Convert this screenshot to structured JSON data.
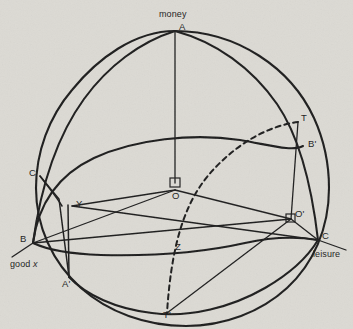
{
  "figure": {
    "background_color": "#dcdad4",
    "ink_color": "#1d1d1d"
  },
  "axis_labels": {
    "money": "money",
    "good_x_prefix": "good ",
    "good_x_italic": "x",
    "leisure": "leisure"
  },
  "points": [
    {
      "id": "A",
      "label": "A",
      "x": 175,
      "y": 31,
      "label_x": 179,
      "label_y": 22
    },
    {
      "id": "B",
      "label": "B",
      "x": 33,
      "y": 243,
      "label_x": 20,
      "label_y": 234
    },
    {
      "id": "C",
      "label": "C",
      "x": 318,
      "y": 240,
      "label_x": 322,
      "label_y": 231
    },
    {
      "id": "O",
      "label": "O",
      "x": 175,
      "y": 190,
      "label_x": 172,
      "label_y": 192
    },
    {
      "id": "O'",
      "label": "O'",
      "x": 291,
      "y": 219,
      "label_x": 295,
      "label_y": 210
    },
    {
      "id": "A'",
      "label": "A'",
      "x": 69,
      "y": 277,
      "label_x": 62,
      "label_y": 279
    },
    {
      "id": "B'",
      "label": "B'",
      "x": 303,
      "y": 146,
      "label_x": 308,
      "label_y": 139
    },
    {
      "id": "C'",
      "label": "C'",
      "x": 40,
      "y": 176,
      "label_x": 30,
      "label_y": 168
    },
    {
      "id": "Y",
      "label": "Y",
      "x": 72,
      "y": 206,
      "label_x": 76,
      "label_y": 200
    },
    {
      "id": "Z",
      "label": "Z",
      "x": 172,
      "y": 247,
      "label_x": 175,
      "label_y": 243
    },
    {
      "id": "T",
      "label": "T",
      "x": 298,
      "y": 122,
      "label_x": 301,
      "label_y": 113
    },
    {
      "id": "T'",
      "label": "T'",
      "x": 167,
      "y": 313,
      "label_x": 164,
      "label_y": 310
    }
  ],
  "markers": {
    "right_angle_O": "right-angle-square",
    "right_angle_O_prime": "right-angle-square"
  },
  "curves": {
    "sphere_outline": "great circle silhouette of the sphere",
    "meridian_A_B": "arc from A (top) to B (lower left)",
    "meridian_A_C": "arc from A (top) through B' to C (lower right)",
    "equator_like_arc": "arc from B through O region to B' (upper band)",
    "lower_arc": "arc from B through Z to C (lower band)",
    "bottom_arc": "arc from A' through T' to C (bottom rim)",
    "dashed_arc": "dashed arc from T through Z to T'",
    "segment_O_A": "vertical line O to A",
    "segment_B_C": "line B to C through O",
    "segment_O_prime_B_prime": "vertical line O' to B' to T",
    "segment_A_prime_Y": "vertical line A' to Y to C'",
    "segment_Y_O_prime": "line Y to O to O'",
    "segment_B_O_prime": "line B to O'",
    "segment_T_prime_O_prime": "line T' to O'"
  }
}
